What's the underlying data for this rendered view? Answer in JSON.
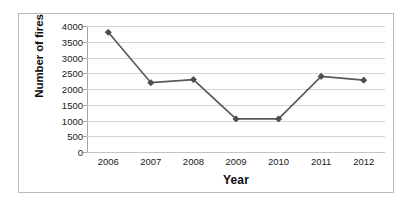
{
  "chart_data": {
    "type": "line",
    "title": "",
    "xlabel": "Year",
    "ylabel": "Number of fires",
    "categories": [
      "2006",
      "2007",
      "2008",
      "2009",
      "2010",
      "2011",
      "2012"
    ],
    "values": [
      3800,
      2200,
      2300,
      1050,
      1050,
      2400,
      2280
    ],
    "series": [
      {
        "name": "Number of fires",
        "values": [
          3800,
          2200,
          2300,
          1050,
          1050,
          2400,
          2280
        ]
      }
    ],
    "ylim": [
      0,
      4000
    ],
    "yticks": [
      0,
      500,
      1000,
      1500,
      2000,
      2500,
      3000,
      3500,
      4000
    ],
    "ytick_labels": [
      "0",
      "500",
      "1000",
      "1500",
      "2000",
      "2500",
      "3000",
      "3500",
      "4000"
    ],
    "xtick_labels": [
      "2006",
      "2007",
      "2008",
      "2009",
      "2010",
      "2011",
      "2012"
    ],
    "grid": "horizontal",
    "legend": "none",
    "marker": "diamond",
    "line_color": "#595959",
    "marker_color": "#4d4d4d",
    "grid_color": "#d4d4d4",
    "axis_color": "#a6a6a6",
    "background": "#ffffff",
    "border_color": "#b9b9b9"
  }
}
